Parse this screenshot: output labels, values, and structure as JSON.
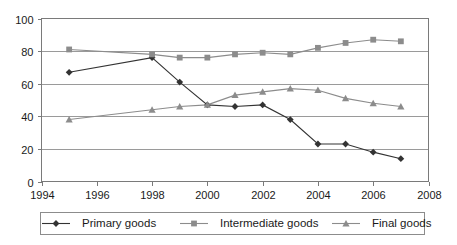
{
  "chart_data": {
    "type": "line",
    "title": "",
    "xlabel": "",
    "ylabel": "",
    "xlim": [
      1994,
      2008
    ],
    "ylim": [
      0,
      100
    ],
    "grid": true,
    "legend_position": "bottom",
    "x_ticks": [
      "1994",
      "1996",
      "1998",
      "2000",
      "2002",
      "2004",
      "2006",
      "2008"
    ],
    "x_tick_values": [
      1994,
      1996,
      1998,
      2000,
      2002,
      2004,
      2006,
      2008
    ],
    "y_ticks": [
      "0",
      "20",
      "40",
      "60",
      "80",
      "100"
    ],
    "y_tick_values": [
      0,
      20,
      40,
      60,
      80,
      100
    ],
    "x": [
      1995,
      1998,
      1999,
      2000,
      2001,
      2002,
      2003,
      2004,
      2005,
      2006,
      2007
    ],
    "series": [
      {
        "name": "Primary goods",
        "marker": "diamond",
        "color": "#333333",
        "values": [
          67,
          76,
          61,
          47,
          46,
          47,
          38,
          23,
          23,
          18,
          14
        ]
      },
      {
        "name": "Intermediate goods",
        "marker": "square",
        "color": "#8c8c8c",
        "values": [
          81,
          78,
          76,
          76,
          78,
          79,
          78,
          82,
          85,
          87,
          86
        ]
      },
      {
        "name": "Final goods",
        "marker": "triangle",
        "color": "#8c8c8c",
        "values": [
          38,
          44,
          46,
          47,
          53,
          55,
          57,
          56,
          51,
          48,
          46
        ]
      }
    ]
  },
  "legend": {
    "items": [
      {
        "label": "Primary goods"
      },
      {
        "label": "Intermediate goods"
      },
      {
        "label": "Final goods"
      }
    ]
  }
}
